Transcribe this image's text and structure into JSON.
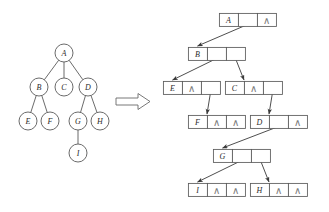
{
  "figure": {
    "transform_arrow": "⇒"
  },
  "tree": {
    "caption": "general-tree",
    "nodes": [
      {
        "id": "A",
        "label": "A",
        "cx": 64,
        "cy": 53
      },
      {
        "id": "B",
        "label": "B",
        "cx": 39,
        "cy": 87
      },
      {
        "id": "C",
        "label": "C",
        "cx": 64,
        "cy": 87
      },
      {
        "id": "D",
        "label": "D",
        "cx": 88,
        "cy": 87
      },
      {
        "id": "E",
        "label": "E",
        "cx": 28,
        "cy": 121
      },
      {
        "id": "F",
        "label": "F",
        "cx": 50,
        "cy": 121
      },
      {
        "id": "G",
        "label": "G",
        "cx": 78,
        "cy": 121
      },
      {
        "id": "H",
        "label": "H",
        "cx": 100,
        "cy": 121
      },
      {
        "id": "I",
        "label": "I",
        "cx": 78,
        "cy": 153
      }
    ],
    "radius": 9,
    "edges": [
      {
        "from": "A",
        "to": "B"
      },
      {
        "from": "A",
        "to": "C"
      },
      {
        "from": "A",
        "to": "D"
      },
      {
        "from": "B",
        "to": "E"
      },
      {
        "from": "B",
        "to": "F"
      },
      {
        "from": "D",
        "to": "G"
      },
      {
        "from": "D",
        "to": "H"
      },
      {
        "from": "G",
        "to": "I"
      }
    ]
  },
  "linked": {
    "caption": "linked-representation",
    "nil_glyph": "∧",
    "cell_width": 19,
    "cell_height": 13,
    "nodes": [
      {
        "id": "A",
        "label": "A",
        "x": 219,
        "y": 13,
        "cells": [
          "label",
          "pointer",
          "nil"
        ]
      },
      {
        "id": "B",
        "label": "B",
        "x": 188,
        "y": 47,
        "cells": [
          "label",
          "pointer",
          "pointer"
        ]
      },
      {
        "id": "E",
        "label": "E",
        "x": 163,
        "y": 81,
        "cells": [
          "label",
          "nil",
          "pointer"
        ]
      },
      {
        "id": "C",
        "label": "C",
        "x": 225,
        "y": 81,
        "cells": [
          "label",
          "nil",
          "pointer"
        ]
      },
      {
        "id": "F",
        "label": "F",
        "x": 188,
        "y": 115,
        "cells": [
          "label",
          "nil",
          "nil"
        ]
      },
      {
        "id": "D",
        "label": "D",
        "x": 250,
        "y": 115,
        "cells": [
          "label",
          "pointer",
          "nil"
        ]
      },
      {
        "id": "G",
        "label": "G",
        "x": 213,
        "y": 149,
        "cells": [
          "label",
          "pointer",
          "pointer"
        ]
      },
      {
        "id": "I",
        "label": "I",
        "x": 188,
        "y": 183,
        "cells": [
          "label",
          "nil",
          "nil"
        ]
      },
      {
        "id": "H",
        "label": "H",
        "x": 250,
        "y": 183,
        "cells": [
          "label",
          "nil",
          "nil"
        ]
      }
    ],
    "pointers": [
      {
        "from": "A",
        "slot": 1,
        "to": "B",
        "kind": "child"
      },
      {
        "from": "B",
        "slot": 1,
        "to": "E",
        "kind": "child"
      },
      {
        "from": "B",
        "slot": 2,
        "to": "C",
        "kind": "sibling"
      },
      {
        "from": "E",
        "slot": 2,
        "to": "F",
        "kind": "sibling"
      },
      {
        "from": "C",
        "slot": 2,
        "to": "D",
        "kind": "sibling"
      },
      {
        "from": "D",
        "slot": 1,
        "to": "G",
        "kind": "child"
      },
      {
        "from": "G",
        "slot": 1,
        "to": "I",
        "kind": "child"
      },
      {
        "from": "G",
        "slot": 2,
        "to": "H",
        "kind": "sibling"
      }
    ]
  }
}
